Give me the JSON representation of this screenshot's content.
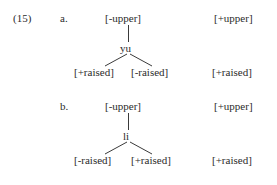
{
  "figure": {
    "example_number": "(15)",
    "font_color": "#2b2b2b",
    "background_color": "#ffffff",
    "line_color": "#3a3a3a"
  },
  "items": [
    {
      "letter": "a.",
      "root_label": "[-upper]",
      "terminal_word": "yu",
      "left_leaf": "[+raised]",
      "right_leaf": "[-raised]",
      "right_column_upper": "[+upper]",
      "right_column_raised": "[+raised]"
    },
    {
      "letter": "b.",
      "root_label": "[-upper]",
      "terminal_word": "li",
      "left_leaf": "[-raised]",
      "right_leaf": "[+raised]",
      "right_column_upper": "[+upper]",
      "right_column_raised": "[+raised]"
    }
  ]
}
